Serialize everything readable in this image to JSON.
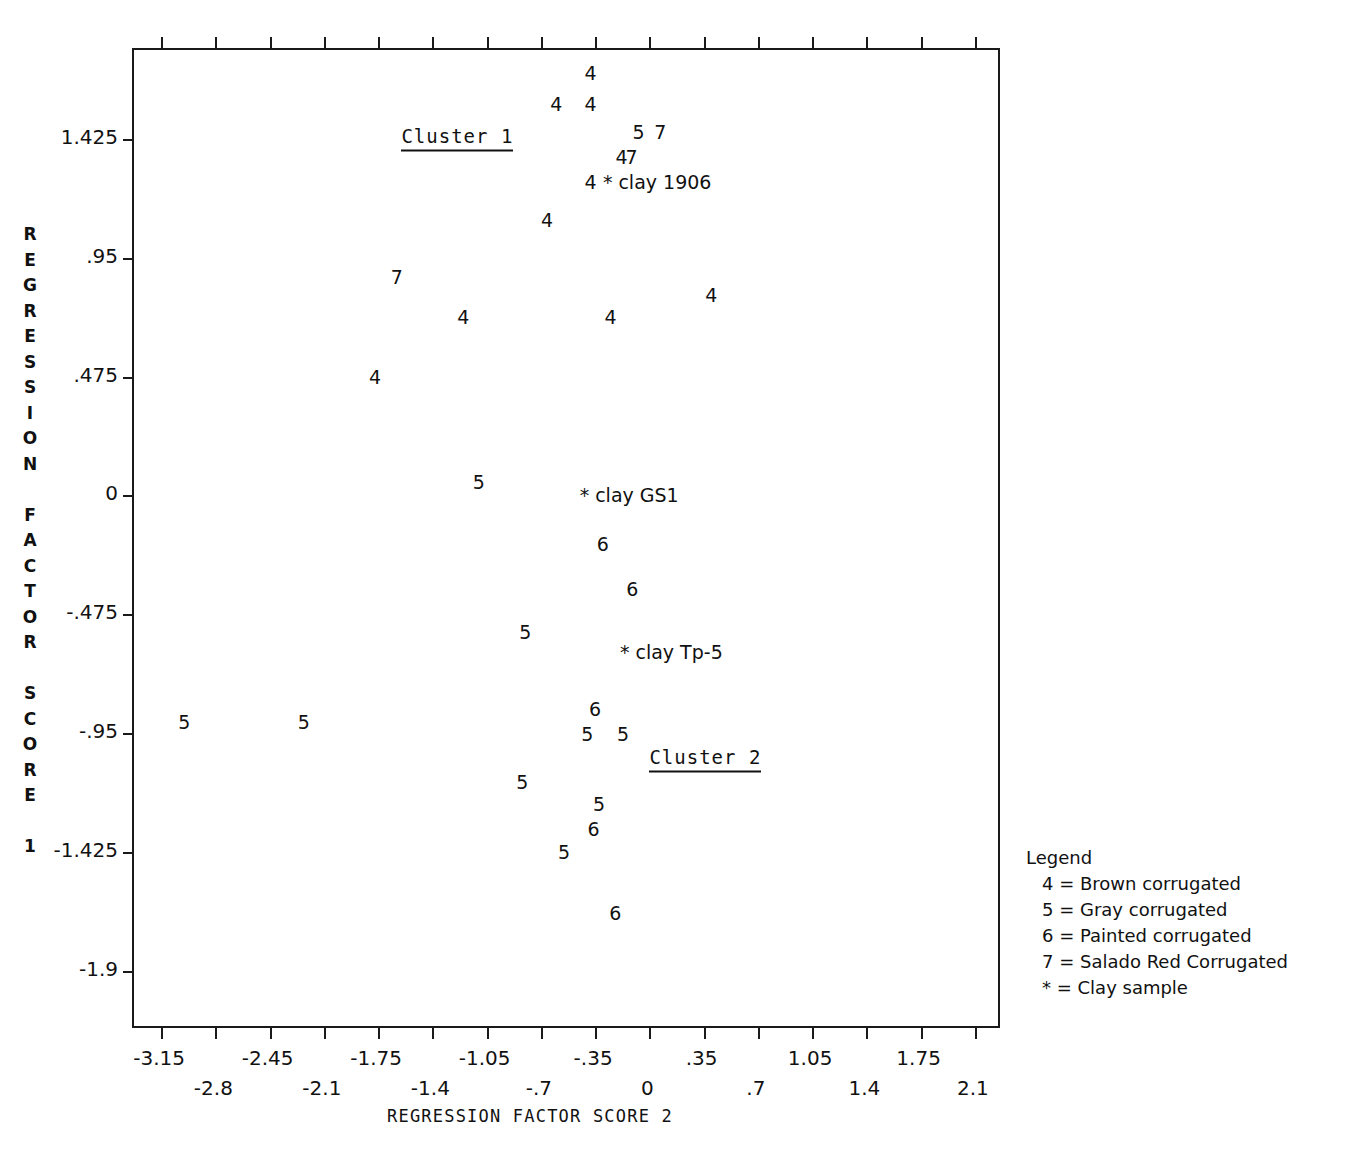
{
  "chart_data": {
    "type": "scatter",
    "title": "",
    "xlabel": "REGRESSION FACTOR SCORE  2",
    "ylabel": "REGRESSION FACTOR SCORE 1",
    "xlim": [
      -3.325,
      2.275
    ],
    "ylim": [
      -2.1375,
      1.7813
    ],
    "grid": false,
    "legend_position": "right-bottom",
    "x_ticks": [
      -3.15,
      -2.8,
      -2.45,
      -2.1,
      -1.75,
      -1.4,
      -1.05,
      -0.7,
      -0.35,
      0,
      0.35,
      0.7,
      1.05,
      1.4,
      1.75,
      2.1
    ],
    "x_tick_labels": [
      "-3.15",
      "-2.8",
      "-2.45",
      "-2.1",
      "-1.75",
      "-1.4",
      "-1.05",
      "-.7",
      "-.35",
      "0",
      ".35",
      ".7",
      "1.05",
      "1.4",
      "1.75",
      "2.1"
    ],
    "y_ticks": [
      1.425,
      0.95,
      0.475,
      0,
      -0.475,
      -0.95,
      -1.425,
      -1.9
    ],
    "y_tick_labels": [
      "1.425",
      ".95",
      ".475",
      "0",
      "-.475",
      "-.95",
      "-1.425",
      "-1.9"
    ],
    "marker_meaning": {
      "4": "Brown corrugated",
      "5": "Gray corrugated",
      "6": "Painted corrugated",
      "7": "Salado Red Corrugated",
      "*": "Clay sample"
    },
    "points": [
      {
        "label": "4",
        "x": -0.38,
        "y": 1.69
      },
      {
        "label": "4",
        "x": -0.6,
        "y": 1.565
      },
      {
        "label": "4",
        "x": -0.38,
        "y": 1.565
      },
      {
        "label": "5",
        "x": -0.07,
        "y": 1.455
      },
      {
        "label": "7",
        "x": 0.07,
        "y": 1.455
      },
      {
        "label": "4",
        "x": -0.18,
        "y": 1.355
      },
      {
        "label": "7",
        "x": -0.115,
        "y": 1.355
      },
      {
        "label": "4",
        "x": -0.38,
        "y": 1.255
      },
      {
        "label": "4",
        "x": -0.66,
        "y": 1.1
      },
      {
        "label": "7",
        "x": -1.63,
        "y": 0.875
      },
      {
        "label": "4",
        "x": 0.4,
        "y": 0.8
      },
      {
        "label": "4",
        "x": -1.2,
        "y": 0.715
      },
      {
        "label": "4",
        "x": -0.25,
        "y": 0.715
      },
      {
        "label": "4",
        "x": -1.77,
        "y": 0.475
      },
      {
        "label": "5",
        "x": -1.1,
        "y": 0.055
      },
      {
        "label": "6",
        "x": -0.3,
        "y": -0.195
      },
      {
        "label": "6",
        "x": -0.11,
        "y": -0.375
      },
      {
        "label": "5",
        "x": -0.8,
        "y": -0.545
      },
      {
        "label": "5",
        "x": -3.0,
        "y": -0.905
      },
      {
        "label": "5",
        "x": -2.23,
        "y": -0.905
      },
      {
        "label": "6",
        "x": -0.35,
        "y": -0.855
      },
      {
        "label": "5",
        "x": -0.4,
        "y": -0.955
      },
      {
        "label": "5",
        "x": -0.17,
        "y": -0.955
      },
      {
        "label": "5",
        "x": -0.82,
        "y": -1.145
      },
      {
        "label": "5",
        "x": -0.325,
        "y": -1.235
      },
      {
        "label": "6",
        "x": -0.36,
        "y": -1.335
      },
      {
        "label": "5",
        "x": -0.55,
        "y": -1.425
      },
      {
        "label": "6",
        "x": -0.22,
        "y": -1.67
      }
    ],
    "annotations": [
      {
        "text": "* clay 1906",
        "x": -0.3,
        "y": 1.255
      },
      {
        "text": "* clay GS1",
        "x": -0.45,
        "y": 0.0
      },
      {
        "text": "* clay Tp-5",
        "x": -0.19,
        "y": -0.625
      }
    ],
    "cluster_labels": [
      {
        "text": "Cluster 1",
        "x": -1.6,
        "y": 1.43
      },
      {
        "text": "Cluster 2",
        "x": 0.0,
        "y": -1.055
      }
    ]
  },
  "legend": {
    "title": "Legend",
    "rows": [
      "4 = Brown corrugated",
      "5 = Gray corrugated",
      "6 = Painted corrugated",
      "7 = Salado Red Corrugated",
      "* = Clay sample"
    ]
  },
  "axis_titles": {
    "x": "REGRESSION FACTOR SCORE  2",
    "y_letters": [
      "R",
      "E",
      "G",
      "R",
      "E",
      "S",
      "S",
      "I",
      "O",
      "N",
      "",
      "F",
      "A",
      "C",
      "T",
      "O",
      "R",
      "",
      "S",
      "C",
      "O",
      "R",
      "E",
      "",
      "1"
    ]
  }
}
